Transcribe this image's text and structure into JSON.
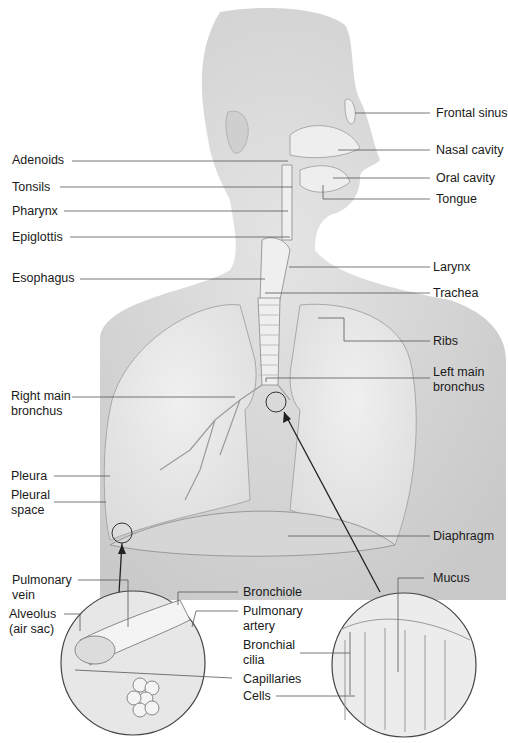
{
  "diagram": {
    "type": "anatomical illustration",
    "colors": {
      "background": "#ffffff",
      "body_fill": "#d9d9d9",
      "lung_fill": "#e6e6e6",
      "leader_line": "#555555",
      "label_text": "#1a1a1a"
    }
  },
  "labels": {
    "left": {
      "adenoids": "Adenoids",
      "tonsils": "Tonsils",
      "pharynx": "Pharynx",
      "epiglottis": "Epiglottis",
      "esophagus": "Esophagus",
      "right_main_bronchus": "Right main bronchus",
      "pleura": "Pleura",
      "pleural_space": "Pleural space"
    },
    "right": {
      "frontal_sinus": "Frontal sinus",
      "nasal_cavity": "Nasal cavity",
      "oral_cavity": "Oral cavity",
      "tongue": "Tongue",
      "larynx": "Larynx",
      "trachea": "Trachea",
      "ribs": "Ribs",
      "left_main_bronchus": "Left main bronchus",
      "diaphragm": "Diaphragm"
    },
    "inset_alveolus": {
      "pulmonary_vein": "Pulmonary vein",
      "alveolus": "Alveolus (air sac)",
      "bronchiole": "Bronchiole",
      "pulmonary_artery": "Pulmonary artery",
      "capillaries": "Capillaries"
    },
    "inset_bronchus": {
      "mucus": "Mucus",
      "bronchial_cilia": "Bronchial cilia",
      "cells": "Cells"
    }
  }
}
